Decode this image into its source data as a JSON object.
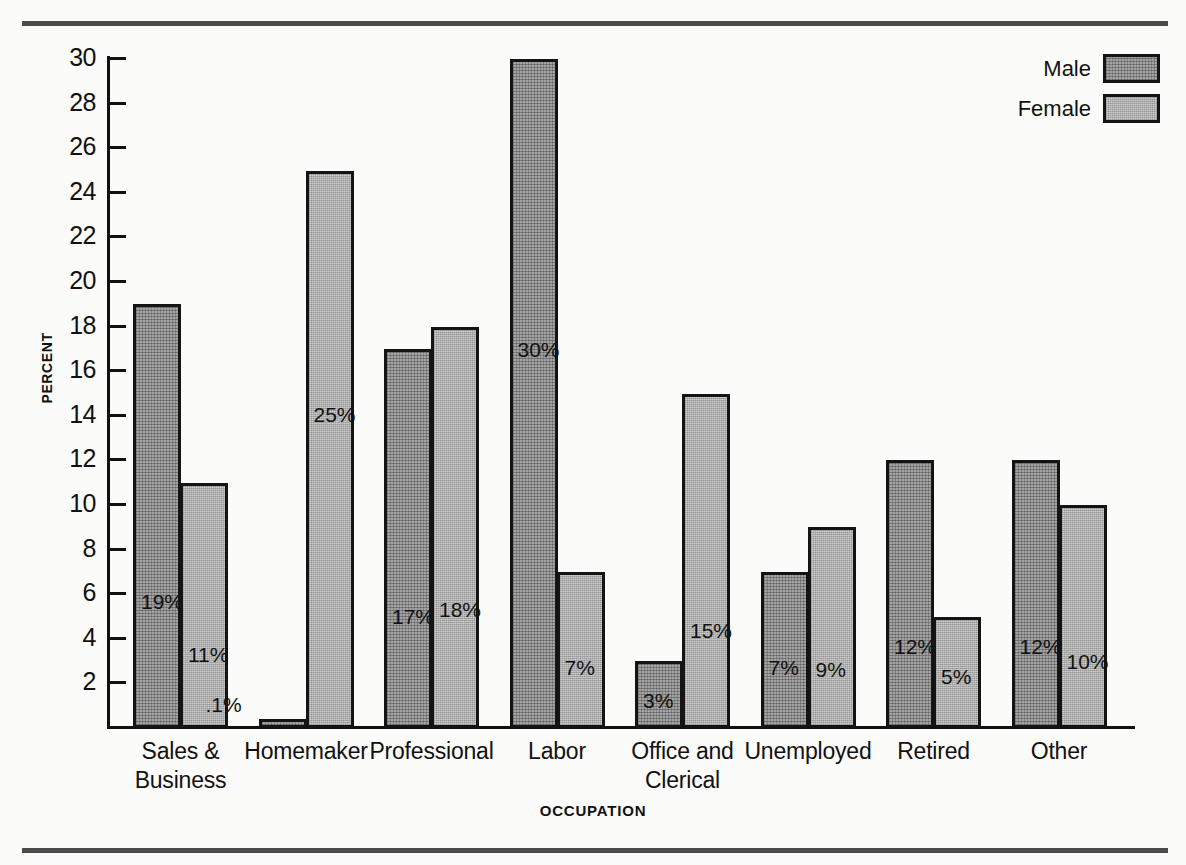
{
  "chart_data": {
    "type": "bar",
    "title": "",
    "xlabel": "OCCUPATION",
    "ylabel": "PERCENT",
    "ylim": [
      0,
      30
    ],
    "ytick_step": 2,
    "yticks": [
      30,
      28,
      26,
      24,
      22,
      20,
      18,
      16,
      14,
      12,
      10,
      8,
      6,
      4,
      2
    ],
    "ytick_labels": [
      "30",
      "28",
      "26",
      "24",
      "22",
      "20",
      "18",
      "16",
      "14",
      "12",
      "10",
      "8",
      "6",
      "4",
      "2"
    ],
    "grid": false,
    "legend_position": "top-right",
    "categories": [
      "Sales &\nBusiness",
      "Homemaker",
      "Professional",
      "Labor",
      "Office and\nClerical",
      "Unemployed",
      "Retired",
      "Other"
    ],
    "category_lines": [
      [
        "Sales &",
        "Business"
      ],
      [
        "Homemaker"
      ],
      [
        "Professional"
      ],
      [
        "Labor"
      ],
      [
        "Office and",
        "Clerical"
      ],
      [
        "Unemployed"
      ],
      [
        "Retired"
      ],
      [
        "Other"
      ]
    ],
    "series": [
      {
        "name": "Male",
        "color": "#909090",
        "values": [
          19,
          0.1,
          17,
          30,
          3,
          7,
          12,
          12
        ],
        "labels": [
          "19%",
          ".1%",
          "17%",
          "30%",
          "3%",
          "7%",
          "12%",
          "12%"
        ]
      },
      {
        "name": "Female",
        "color": "#b9b9b9",
        "values": [
          11,
          25,
          18,
          7,
          15,
          9,
          5,
          10
        ],
        "labels": [
          "11%",
          "25%",
          "18%",
          "7%",
          "15%",
          "9%",
          "5%",
          "10%"
        ]
      }
    ]
  },
  "legend": {
    "items": [
      {
        "label": "Male",
        "swatch": "male-swatch"
      },
      {
        "label": "Female",
        "swatch": "female-swatch"
      }
    ]
  },
  "axes": {
    "y_title": "PERCENT",
    "x_title": "OCCUPATION"
  },
  "bar_value_labels": {
    "sales_business_male": "19%",
    "sales_business_female": "11%",
    "homemaker_male": ".1%",
    "homemaker_female": "25%",
    "professional_male": "17%",
    "professional_female": "18%",
    "labor_male": "30%",
    "labor_female": "7%",
    "office_clerical_male": "3%",
    "office_clerical_female": "15%",
    "unemployed_male": "7%",
    "unemployed_female": "9%",
    "retired_male": "12%",
    "retired_female": "5%",
    "other_male": "12%",
    "other_female": "10%"
  }
}
